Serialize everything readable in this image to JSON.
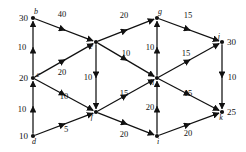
{
  "figure": {
    "name": "transportation-network-graph",
    "type": "directed-weighted-graph"
  },
  "chart_data": {
    "type": "diagram",
    "title": "",
    "nodes": [
      {
        "id": "b",
        "label": "b",
        "supply": "30",
        "x": 33,
        "y": 18,
        "supply_side": "left"
      },
      {
        "id": "c",
        "label": "c",
        "supply": "20",
        "x": 33,
        "y": 78,
        "supply_side": "left"
      },
      {
        "id": "d",
        "label": "d",
        "supply": "10",
        "x": 33,
        "y": 136,
        "supply_side": "left"
      },
      {
        "id": "e",
        "label": "e",
        "supply": "",
        "x": 96,
        "y": 42,
        "supply_side": ""
      },
      {
        "id": "f",
        "label": "f",
        "supply": "",
        "x": 96,
        "y": 112,
        "supply_side": ""
      },
      {
        "id": "g",
        "label": "g",
        "supply": "",
        "x": 157,
        "y": 18,
        "supply_side": ""
      },
      {
        "id": "h",
        "label": "h",
        "supply": "",
        "x": 157,
        "y": 78,
        "supply_side": ""
      },
      {
        "id": "i",
        "label": "i",
        "supply": "",
        "x": 157,
        "y": 136,
        "supply_side": ""
      },
      {
        "id": "j",
        "label": "j",
        "supply": "30",
        "x": 222,
        "y": 42,
        "supply_side": "right"
      },
      {
        "id": "k",
        "label": "k",
        "supply": "25",
        "x": 222,
        "y": 112,
        "supply_side": "right"
      }
    ],
    "edges": [
      {
        "from": "d",
        "to": "c",
        "weight": "10",
        "lx": 22,
        "ly": 112
      },
      {
        "from": "c",
        "to": "b",
        "weight": "10",
        "lx": 22,
        "ly": 50
      },
      {
        "from": "b",
        "to": "e",
        "weight": "40",
        "lx": 62,
        "ly": 17
      },
      {
        "from": "c",
        "to": "e",
        "weight": "20",
        "lx": 62,
        "ly": 75
      },
      {
        "from": "e",
        "to": "g",
        "weight": "20",
        "lx": 124,
        "ly": 18
      },
      {
        "from": "e",
        "to": "f",
        "weight": "10",
        "lx": 88,
        "ly": 80
      },
      {
        "from": "e",
        "to": "h",
        "weight": "10",
        "lx": 126,
        "ly": 56
      },
      {
        "from": "c",
        "to": "f",
        "weight": "10",
        "lx": 64,
        "ly": 99
      },
      {
        "from": "d",
        "to": "f",
        "weight": "5",
        "lx": 66,
        "ly": 132
      },
      {
        "from": "f",
        "to": "h",
        "weight": "15",
        "lx": 124,
        "ly": 96
      },
      {
        "from": "f",
        "to": "i",
        "weight": "20",
        "lx": 124,
        "ly": 137
      },
      {
        "from": "h",
        "to": "g",
        "weight": "10",
        "lx": 150,
        "ly": 50
      },
      {
        "from": "i",
        "to": "h",
        "weight": "20",
        "lx": 150,
        "ly": 110
      },
      {
        "from": "g",
        "to": "j",
        "weight": "15",
        "lx": 188,
        "ly": 18
      },
      {
        "from": "h",
        "to": "j",
        "weight": "15",
        "lx": 186,
        "ly": 56
      },
      {
        "from": "h",
        "to": "k",
        "weight": "15",
        "lx": 188,
        "ly": 96
      },
      {
        "from": "i",
        "to": "k",
        "weight": "20",
        "lx": 188,
        "ly": 136
      },
      {
        "from": "j",
        "to": "k",
        "weight": "10",
        "lx": 232,
        "ly": 80
      }
    ]
  }
}
